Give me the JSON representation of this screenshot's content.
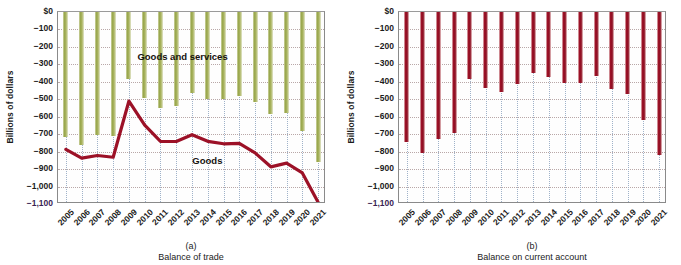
{
  "chart_data": [
    {
      "type": "bar",
      "panel": "a",
      "title": "",
      "caption_id": "(a)",
      "caption": "Balance of trade",
      "xlabel": "",
      "ylabel": "Billions of dollars",
      "ylim": [
        -1100,
        0
      ],
      "yticks": [
        0,
        -100,
        -200,
        -300,
        -400,
        -500,
        -600,
        -700,
        -800,
        -900,
        -1000,
        -1100
      ],
      "ytick_labels": [
        "$0",
        "−100",
        "−200",
        "−300",
        "−400",
        "−500",
        "−600",
        "−700",
        "−800",
        "−900",
        "−1,000",
        "−1,100"
      ],
      "grid": true,
      "legend_position": "inline-annotation",
      "categories": [
        "2005",
        "2006",
        "2007",
        "2008",
        "2009",
        "2010",
        "2011",
        "2012",
        "2013",
        "2014",
        "2015",
        "2016",
        "2017",
        "2018",
        "2019",
        "2020",
        "2021"
      ],
      "series": [
        {
          "name": "Goods and services",
          "kind": "bar",
          "color": "#9aa84f",
          "values": [
            -714,
            -762,
            -705,
            -709,
            -384,
            -495,
            -549,
            -537,
            -462,
            -500,
            -500,
            -481,
            -517,
            -583,
            -577,
            -682,
            -861
          ]
        },
        {
          "name": "Goods",
          "kind": "line",
          "color": "#9c1127",
          "values": [
            -787,
            -837,
            -822,
            -832,
            -510,
            -648,
            -741,
            -742,
            -703,
            -741,
            -755,
            -753,
            -807,
            -887,
            -866,
            -922,
            -1090
          ]
        }
      ],
      "annotations": [
        {
          "text": "Goods and services",
          "x_frac": 0.3,
          "y_value": -265
        },
        {
          "text": "Goods",
          "x_frac": 0.505,
          "y_value": -862
        }
      ]
    },
    {
      "type": "bar",
      "panel": "b",
      "title": "",
      "caption_id": "(b)",
      "caption": "Balance on current account",
      "xlabel": "",
      "ylabel": "Billions of dollars",
      "ylim": [
        -1100,
        0
      ],
      "yticks": [
        0,
        -100,
        -200,
        -300,
        -400,
        -500,
        -600,
        -700,
        -800,
        -900,
        -1000,
        -1100
      ],
      "ytick_labels": [
        "$0",
        "−100",
        "−200",
        "−300",
        "−400",
        "−500",
        "−600",
        "−700",
        "−800",
        "−900",
        "−1,000",
        "−1,100"
      ],
      "grid": true,
      "categories": [
        "2005",
        "2006",
        "2007",
        "2008",
        "2009",
        "2010",
        "2011",
        "2012",
        "2013",
        "2014",
        "2015",
        "2016",
        "2017",
        "2018",
        "2019",
        "2020",
        "2021"
      ],
      "series": [
        {
          "name": "Balance on current account",
          "kind": "bar",
          "color": "#9c1127",
          "values": [
            -746,
            -806,
            -729,
            -692,
            -384,
            -436,
            -459,
            -415,
            -348,
            -374,
            -408,
            -404,
            -367,
            -439,
            -472,
            -616,
            -822
          ]
        }
      ]
    }
  ]
}
